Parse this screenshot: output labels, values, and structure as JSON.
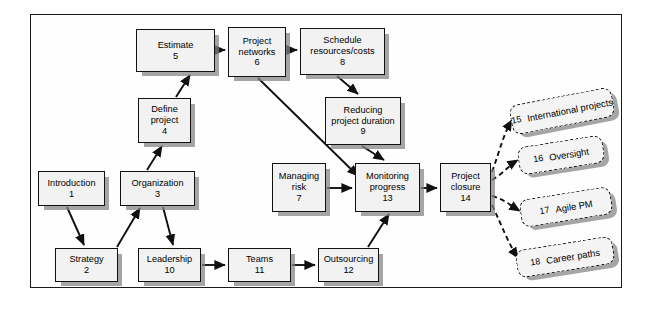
{
  "diagram": {
    "style": {
      "node_fill": "#f2f2f2",
      "node_border": "#111111",
      "shadow": "#828282",
      "frame_border": "#1a1a1a",
      "page_background": "#ffffff"
    },
    "nodes": [
      {
        "id": "n5",
        "label": "Estimate",
        "number": "5",
        "x": 136,
        "y": 29,
        "w": 79,
        "h": 43,
        "shape": "solid"
      },
      {
        "id": "n6",
        "label": "Project\nnetworks",
        "number": "6",
        "x": 228,
        "y": 27,
        "w": 58,
        "h": 50,
        "shape": "solid"
      },
      {
        "id": "n8",
        "label": "Schedule\nresources/costs",
        "number": "8",
        "x": 300,
        "y": 28,
        "w": 85,
        "h": 47,
        "shape": "solid"
      },
      {
        "id": "n4",
        "label": "Define\nproject",
        "number": "4",
        "x": 138,
        "y": 98,
        "w": 53,
        "h": 45,
        "shape": "solid"
      },
      {
        "id": "n9",
        "label": "Reducing\nproject duration",
        "number": "9",
        "x": 325,
        "y": 97,
        "w": 76,
        "h": 48,
        "shape": "solid"
      },
      {
        "id": "n1",
        "label": "Introduction",
        "number": "1",
        "x": 38,
        "y": 171,
        "w": 67,
        "h": 35,
        "shape": "solid"
      },
      {
        "id": "n3",
        "label": "Organization",
        "number": "3",
        "x": 120,
        "y": 171,
        "w": 75,
        "h": 35,
        "shape": "solid"
      },
      {
        "id": "n7",
        "label": "Managing\nrisk",
        "number": "7",
        "x": 272,
        "y": 163,
        "w": 54,
        "h": 49,
        "shape": "solid"
      },
      {
        "id": "n13",
        "label": "Monitoring\nprogress",
        "number": "13",
        "x": 355,
        "y": 163,
        "w": 65,
        "h": 49,
        "shape": "solid"
      },
      {
        "id": "n14",
        "label": "Project\nclosure",
        "number": "14",
        "x": 440,
        "y": 163,
        "w": 51,
        "h": 49,
        "shape": "solid"
      },
      {
        "id": "n2",
        "label": "Strategy",
        "number": "2",
        "x": 55,
        "y": 248,
        "w": 63,
        "h": 34,
        "shape": "solid"
      },
      {
        "id": "n10",
        "label": "Leadership",
        "number": "10",
        "x": 138,
        "y": 248,
        "w": 63,
        "h": 34,
        "shape": "solid"
      },
      {
        "id": "n11",
        "label": "Teams",
        "number": "11",
        "x": 228,
        "y": 248,
        "w": 63,
        "h": 34,
        "shape": "solid"
      },
      {
        "id": "n12",
        "label": "Outsourcing",
        "number": "12",
        "x": 318,
        "y": 248,
        "w": 61,
        "h": 34,
        "shape": "solid"
      }
    ],
    "optional_nodes": [
      {
        "id": "n15",
        "label": "International projects",
        "number": "15",
        "x": 510,
        "y": 96,
        "w": 104,
        "h": 30,
        "rotate": -11
      },
      {
        "id": "n16",
        "label": "Oversight",
        "number": "16",
        "x": 518,
        "y": 141,
        "w": 86,
        "h": 28,
        "rotate": -9
      },
      {
        "id": "n17",
        "label": "Agile PM",
        "number": "17",
        "x": 520,
        "y": 193,
        "w": 92,
        "h": 28,
        "rotate": -9
      },
      {
        "id": "n18",
        "label": "Career paths",
        "number": "18",
        "x": 516,
        "y": 243,
        "w": 98,
        "h": 28,
        "rotate": -9
      }
    ],
    "edges": [
      {
        "from": "n5",
        "to": "n6",
        "style": "solid"
      },
      {
        "from": "n6",
        "to": "n8",
        "style": "solid"
      },
      {
        "from": "n8",
        "to": "n9",
        "style": "solid"
      },
      {
        "from": "n4",
        "to": "n5",
        "style": "solid"
      },
      {
        "from": "n3",
        "to": "n4",
        "style": "solid"
      },
      {
        "from": "n1",
        "to": "n2",
        "style": "solid"
      },
      {
        "from": "n2",
        "to": "n3",
        "style": "solid"
      },
      {
        "from": "n3",
        "to": "n10",
        "style": "solid"
      },
      {
        "from": "n6",
        "to": "n13",
        "style": "solid"
      },
      {
        "from": "n9",
        "to": "n13",
        "style": "solid"
      },
      {
        "from": "n7",
        "to": "n13",
        "style": "solid"
      },
      {
        "from": "n13",
        "to": "n14",
        "style": "solid"
      },
      {
        "from": "n10",
        "to": "n11",
        "style": "solid"
      },
      {
        "from": "n11",
        "to": "n12",
        "style": "solid"
      },
      {
        "from": "n12",
        "to": "n13",
        "style": "solid"
      },
      {
        "from": "n14",
        "to": "n15",
        "style": "dashed"
      },
      {
        "from": "n14",
        "to": "n16",
        "style": "dashed"
      },
      {
        "from": "n14",
        "to": "n17",
        "style": "dashed"
      },
      {
        "from": "n14",
        "to": "n18",
        "style": "dashed"
      }
    ]
  }
}
